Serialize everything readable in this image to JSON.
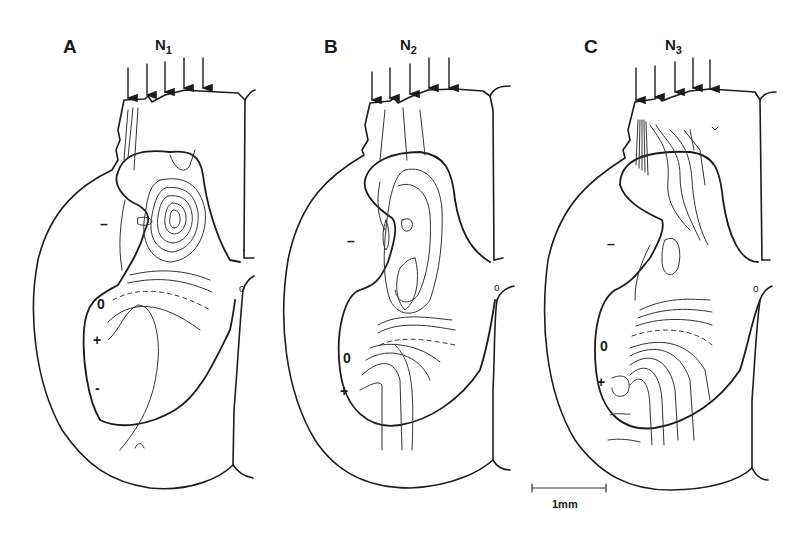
{
  "figure": {
    "panels": [
      {
        "letter": "A",
        "stimulus_label": "N",
        "stimulus_index": "1",
        "arrow_count": 5,
        "signs": {
          "upper_negative": "–",
          "zero": "0",
          "positive": "+",
          "lower_negative": "-"
        },
        "midline_mark": "o"
      },
      {
        "letter": "B",
        "stimulus_label": "N",
        "stimulus_index": "2",
        "arrow_count": 5,
        "signs": {
          "upper_negative": "–",
          "zero": "0",
          "positive": "+"
        },
        "midline_mark": "o"
      },
      {
        "letter": "C",
        "stimulus_label": "N",
        "stimulus_index": "3",
        "arrow_count": 5,
        "signs": {
          "upper_negative": "–",
          "zero": "0",
          "positive": "+"
        },
        "midline_mark": "o"
      }
    ],
    "scale_bar": {
      "label": "1mm"
    },
    "colors": {
      "ink": "#1c1c1c",
      "background": "#ffffff"
    }
  }
}
